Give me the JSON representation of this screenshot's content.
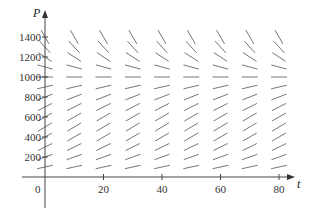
{
  "chart_data": {
    "type": "slope_field",
    "title": "",
    "xlabel": "t",
    "ylabel": "P",
    "xlim": [
      0,
      85
    ],
    "ylim": [
      0,
      1500
    ],
    "x_ticks": [
      0,
      20,
      40,
      60,
      80
    ],
    "x_tick_labels": [
      "0",
      "20",
      "40",
      "60",
      "80"
    ],
    "y_ticks": [
      200,
      400,
      600,
      800,
      1000,
      1200,
      1400
    ],
    "y_tick_labels": [
      "200",
      "400",
      "600",
      "800",
      "1000",
      "1200",
      "1400"
    ],
    "origin_label": "0",
    "grid": false,
    "legend": null,
    "field_columns_t": [
      0,
      10,
      20,
      30,
      40,
      50,
      60,
      70,
      80
    ],
    "field_rows_P": [
      100,
      200,
      300,
      400,
      500,
      600,
      700,
      800,
      900,
      1000,
      1100,
      1200,
      1300,
      1400
    ],
    "equilibrium_P": 1000,
    "segment_angles_deg_by_row": {
      "100": 12,
      "200": 20,
      "300": 26,
      "400": 30,
      "500": 31,
      "600": 30,
      "700": 27,
      "800": 21,
      "900": 13,
      "1000": 0,
      "1100": -15,
      "1200": -33,
      "1300": -48,
      "1400": -60
    },
    "colors": {
      "axis": "#444444",
      "segment": "#666666",
      "text": "#333333"
    }
  }
}
